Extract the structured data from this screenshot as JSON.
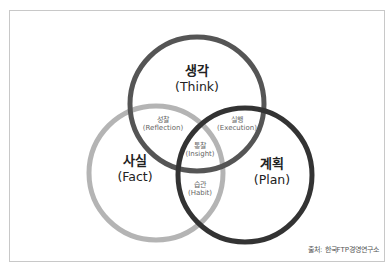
{
  "diagram": {
    "type": "venn",
    "circles": [
      {
        "id": "think",
        "label_ko": "생각",
        "label_en": "(Think)",
        "color": "#555555"
      },
      {
        "id": "fact",
        "label_ko": "사실",
        "label_en": "(Fact)",
        "color": "#b4b4b4"
      },
      {
        "id": "plan",
        "label_ko": "계획",
        "label_en": "(Plan)",
        "color": "#333333"
      }
    ],
    "intersections": [
      {
        "id": "think-fact",
        "label_ko": "성찰",
        "label_en": "(Reflection)"
      },
      {
        "id": "think-plan",
        "label_ko": "실행",
        "label_en": "(Execution)"
      },
      {
        "id": "all",
        "label_ko": "통찰",
        "label_en": "(Insight)"
      },
      {
        "id": "fact-plan",
        "label_ko": "습관",
        "label_en": "(Habit)"
      }
    ],
    "source": "출처: 한국FTP경영연구소"
  }
}
